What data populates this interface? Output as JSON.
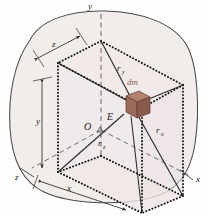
{
  "figure": {
    "background_color": "#fefefe",
    "body": {
      "name": "rigid-body-outline",
      "fill_color": "#f2eceb",
      "stroke_color": "#4a4a4a"
    },
    "box": {
      "name": "bounding-box",
      "style": "dotted",
      "stroke_color": "#111111",
      "face_fill": "#efe7e6"
    },
    "element": {
      "label": "dm",
      "fill_color": "#9d6b5a",
      "top_color": "#b2826f",
      "side_color": "#8a5a4b",
      "stroke_color": "#5d3b30"
    },
    "axes": [
      {
        "name": "y-axis",
        "label": "y",
        "x": 88,
        "y": 9
      },
      {
        "name": "x-axis",
        "label": "x",
        "x": 196,
        "y": 182
      },
      {
        "name": "z-axis",
        "label": "z",
        "x": 15,
        "y": 180
      }
    ],
    "points": [
      {
        "name": "origin",
        "label": "O",
        "x": 84,
        "y": 130
      },
      {
        "name": "point-e",
        "label": "E",
        "x": 107,
        "y": 120
      }
    ],
    "radii": [
      {
        "name": "r-y",
        "base": "r",
        "sub": "y",
        "x": 117,
        "y": 71
      },
      {
        "name": "r-x",
        "base": "r",
        "sub": "x",
        "x": 156,
        "y": 133
      },
      {
        "name": "r-z",
        "base": "r",
        "sub": "z",
        "x": 98,
        "y": 146
      }
    ],
    "dimensions": [
      {
        "name": "dim-z",
        "label": "z",
        "x": 52,
        "y": 47
      },
      {
        "name": "dim-y",
        "label": "y",
        "x": 36,
        "y": 124
      },
      {
        "name": "dim-x",
        "label": "x",
        "x": 67,
        "y": 191
      }
    ]
  }
}
